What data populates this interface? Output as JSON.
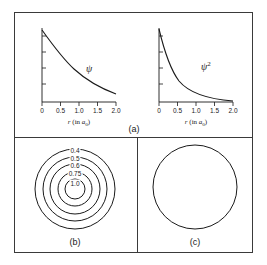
{
  "figure": {
    "panels": [
      {
        "id": "a",
        "label": "(a)",
        "plots": [
          {
            "id": "psi",
            "curve_label": "ψ",
            "curve_label_sup": "",
            "axis_title_prefix": "r",
            "axis_title_mid": " (in ",
            "axis_title_sub": "0",
            "axis_title_suffix": ")",
            "axis_title_symbol": "a",
            "xticks": [
              "0",
              "0.5",
              "1.0",
              "1.5",
              "2.0"
            ],
            "xvalues": [
              0,
              0.5,
              1.0,
              1.5,
              2.0
            ],
            "yticks_count": 5,
            "decay": "exp(-r)"
          },
          {
            "id": "psi-squared",
            "curve_label": "ψ",
            "curve_label_sup": "2",
            "axis_title_prefix": "r",
            "axis_title_mid": " (in ",
            "axis_title_sub": "0",
            "axis_title_suffix": ")",
            "axis_title_symbol": "a",
            "xticks": [
              "0",
              "0.5",
              "1.0",
              "1.5",
              "2.0"
            ],
            "xvalues": [
              0,
              0.5,
              1.0,
              1.5,
              2.0
            ],
            "yticks_count": 5,
            "decay": "exp(-2r)"
          }
        ]
      },
      {
        "id": "b",
        "label": "(b)",
        "contours": [
          {
            "value": "0.4",
            "radius": 40
          },
          {
            "value": "0.5",
            "radius": 32
          },
          {
            "value": "0.6",
            "radius": 25
          },
          {
            "value": "0.75",
            "radius": 17
          },
          {
            "value": "1.0",
            "radius": 10
          }
        ]
      },
      {
        "id": "c",
        "label": "(c)",
        "boundary_circle_radius": 42
      }
    ]
  },
  "colors": {
    "frame": "#3a3a3a",
    "curve": "#1a1a1a",
    "text": "#1a1a1a",
    "background": "#ffffff"
  }
}
